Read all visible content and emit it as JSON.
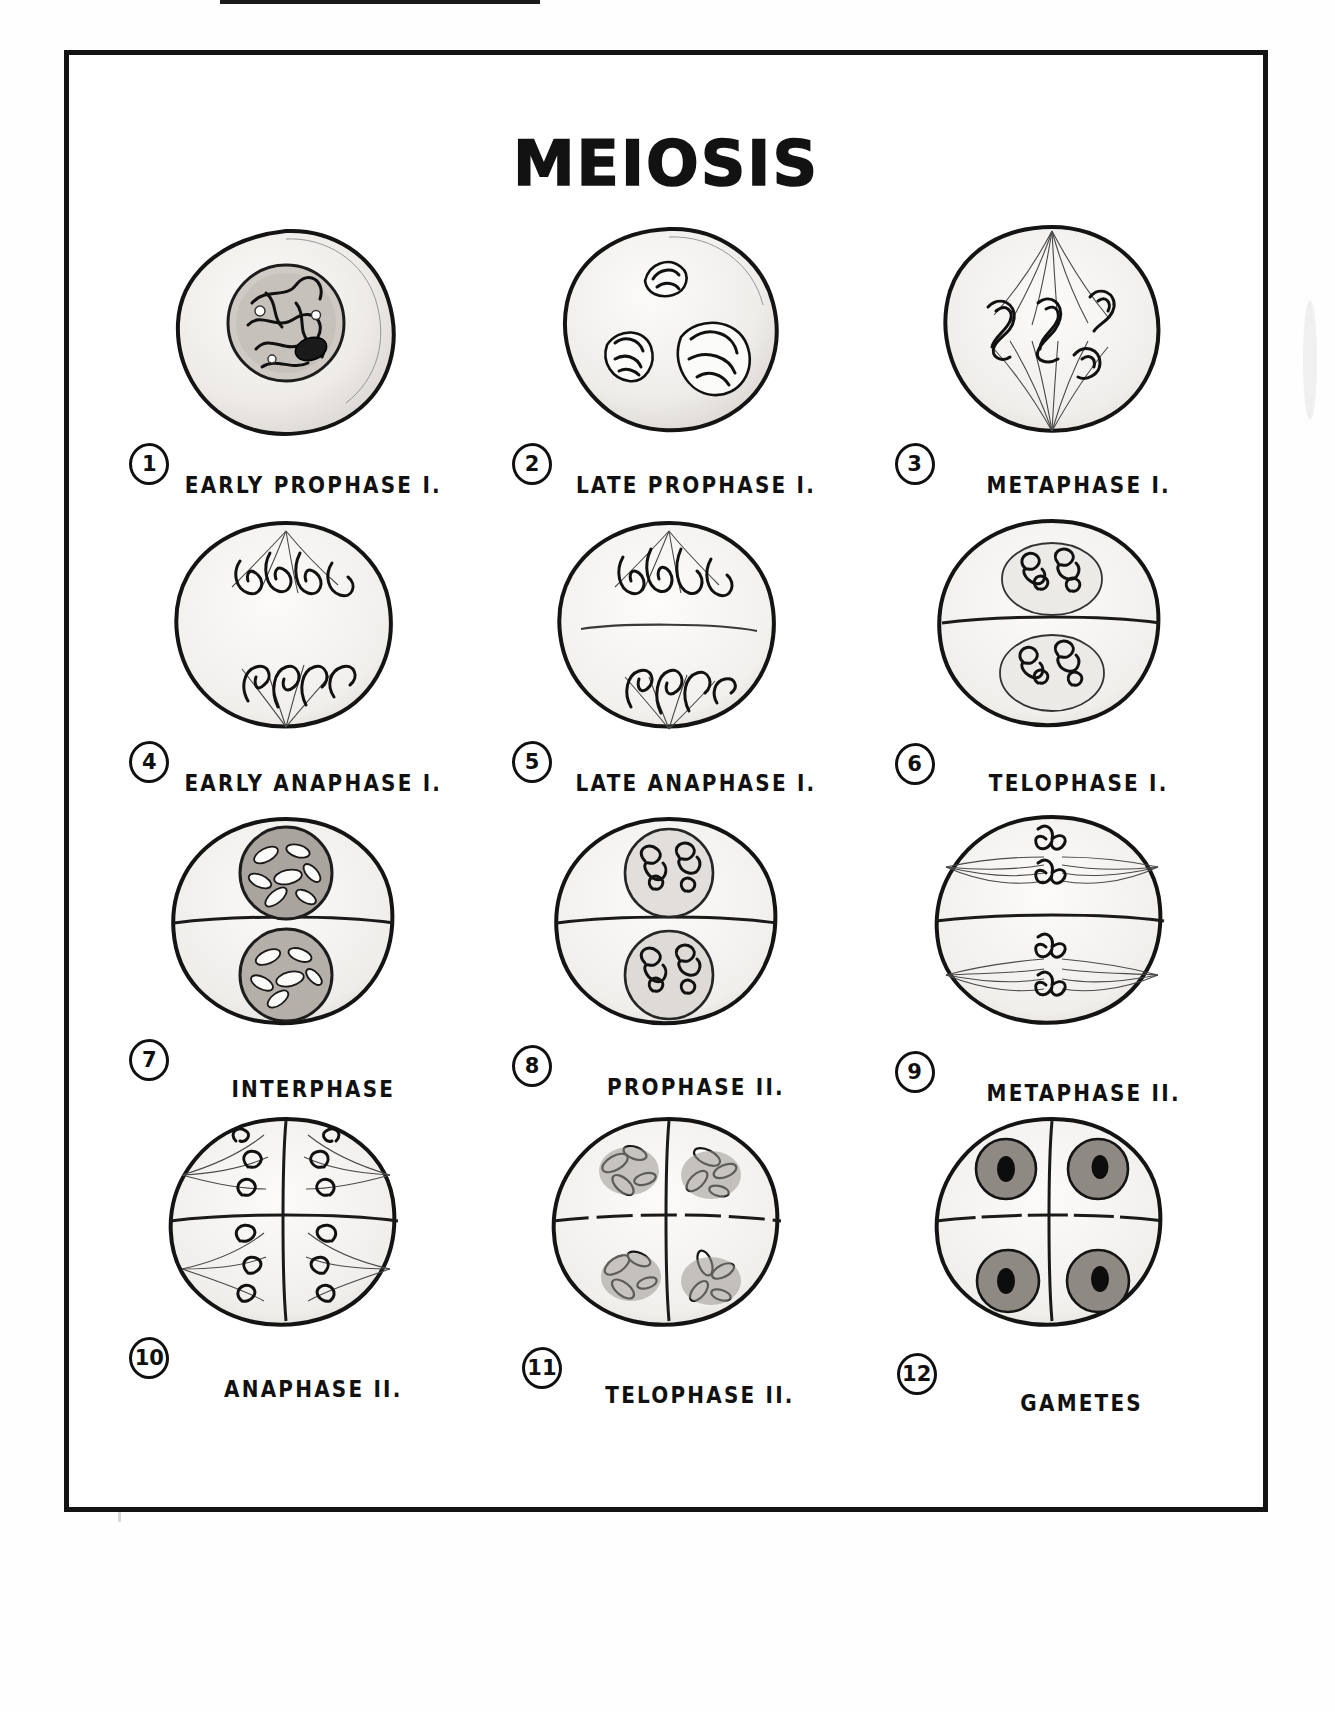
{
  "page": {
    "title": "MEIOSIS",
    "type": "biology-plate",
    "frame_color": "#141414",
    "background_color": "#fefefe",
    "ink_color": "#111111"
  },
  "figures": [
    {
      "number": "1",
      "label": "EARLY  PROPHASE I.",
      "stage": "early-prophase-i"
    },
    {
      "number": "2",
      "label": "LATE  PROPHASE I.",
      "stage": "late-prophase-i"
    },
    {
      "number": "3",
      "label": "METAPHASE I.",
      "stage": "metaphase-i"
    },
    {
      "number": "4",
      "label": "EARLY  ANAPHASE I.",
      "stage": "early-anaphase-i"
    },
    {
      "number": "5",
      "label": "LATE  ANAPHASE I.",
      "stage": "late-anaphase-i"
    },
    {
      "number": "6",
      "label": "TELOPHASE I.",
      "stage": "telophase-i"
    },
    {
      "number": "7",
      "label": "INTERPHASE",
      "stage": "interphase"
    },
    {
      "number": "8",
      "label": "PROPHASE II.",
      "stage": "prophase-ii"
    },
    {
      "number": "9",
      "label": "METAPHASE II.",
      "stage": "metaphase-ii"
    },
    {
      "number": "10",
      "label": "ANAPHASE II.",
      "stage": "anaphase-ii"
    },
    {
      "number": "11",
      "label": "TELOPHASE II.",
      "stage": "telophase-ii"
    },
    {
      "number": "12",
      "label": "GAMETES",
      "stage": "gametes"
    }
  ]
}
